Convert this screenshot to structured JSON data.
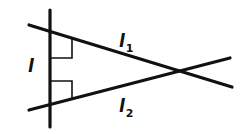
{
  "diagram": {
    "colors": {
      "stroke": "#111111",
      "background": "#ffffff"
    },
    "lines": [
      {
        "id": "l",
        "label": "l",
        "subscript": "",
        "x1": 50,
        "y1": 10,
        "x2": 50,
        "y2": 127
      },
      {
        "id": "l1",
        "label": "l",
        "subscript": "1",
        "x1": 29,
        "y1": 25,
        "x2": 232,
        "y2": 87
      },
      {
        "id": "l2",
        "label": "l",
        "subscript": "2",
        "x1": 29,
        "y1": 110,
        "x2": 230,
        "y2": 58
      }
    ],
    "right_angle_marks": [
      {
        "at": "l ∩ l1",
        "relation": "l1 ⊥ l"
      },
      {
        "at": "l ∩ l2",
        "relation": "l2 ⊥ l"
      }
    ],
    "intersection_l1_l2": {
      "x": 177,
      "y": 71
    },
    "labels": {
      "l": {
        "text": "l",
        "sub": ""
      },
      "l1": {
        "text": "l",
        "sub": "1"
      },
      "l2": {
        "text": "l",
        "sub": "2"
      }
    }
  }
}
